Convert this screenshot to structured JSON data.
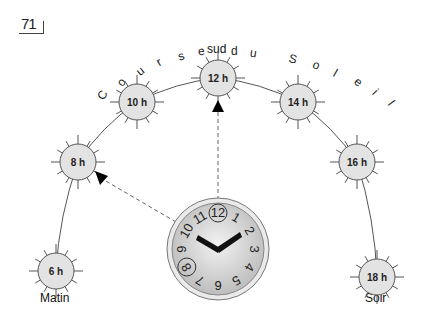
{
  "page_number": "71",
  "title_letters": [
    "C",
    "o",
    "u",
    "r",
    "s",
    "e",
    "d",
    "u",
    "S",
    "o",
    "l",
    "e",
    "i",
    "l"
  ],
  "labels": {
    "south": "sud",
    "morning": "Matin",
    "evening": "Soir"
  },
  "suns": [
    {
      "label": "6 h",
      "x": 56,
      "y": 271
    },
    {
      "label": "8 h",
      "x": 78,
      "y": 162
    },
    {
      "label": "10 h",
      "x": 137,
      "y": 102
    },
    {
      "label": "12 h",
      "x": 218,
      "y": 78
    },
    {
      "label": "14 h",
      "x": 298,
      "y": 102
    },
    {
      "label": "16 h",
      "x": 357,
      "y": 162
    },
    {
      "label": "18 h",
      "x": 377,
      "y": 277
    }
  ],
  "clock": {
    "numbers": [
      "12",
      "1",
      "2",
      "3",
      "4",
      "5",
      "6",
      "7",
      "8",
      "9",
      "10",
      "11"
    ],
    "highlighted": [
      "8",
      "12"
    ]
  },
  "colors": {
    "sun_fill": "#e3e3e3",
    "stroke": "#555555",
    "clock_face": "#cfcfcf",
    "hand": "#111111"
  }
}
